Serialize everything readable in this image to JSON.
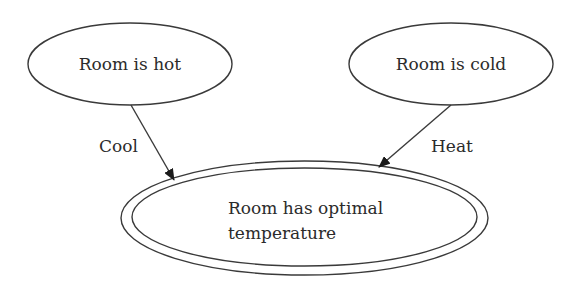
{
  "diagram": {
    "type": "state-diagram",
    "nodes": [
      {
        "id": "hot",
        "label": "Room is hot",
        "shape": "ellipse",
        "cx": 130,
        "cy": 64,
        "rx": 102,
        "ry": 41
      },
      {
        "id": "cold",
        "label": "Room is cold",
        "shape": "ellipse",
        "cx": 451,
        "cy": 64,
        "rx": 102,
        "ry": 41
      },
      {
        "id": "optimal",
        "label_line1": "Room has optimal",
        "label_line2": "temperature",
        "shape": "double-ellipse",
        "cx": 304,
        "cy": 218,
        "rx": 183,
        "ry": 57,
        "inner_rx": 172,
        "inner_ry": 49
      }
    ],
    "edges": [
      {
        "from": "hot",
        "to": "optimal",
        "label": "Cool"
      },
      {
        "from": "cold",
        "to": "optimal",
        "label": "Heat"
      }
    ]
  },
  "colors": {
    "stroke": "#3a3a3a",
    "text": "#2b2b2b",
    "background": "#ffffff"
  }
}
